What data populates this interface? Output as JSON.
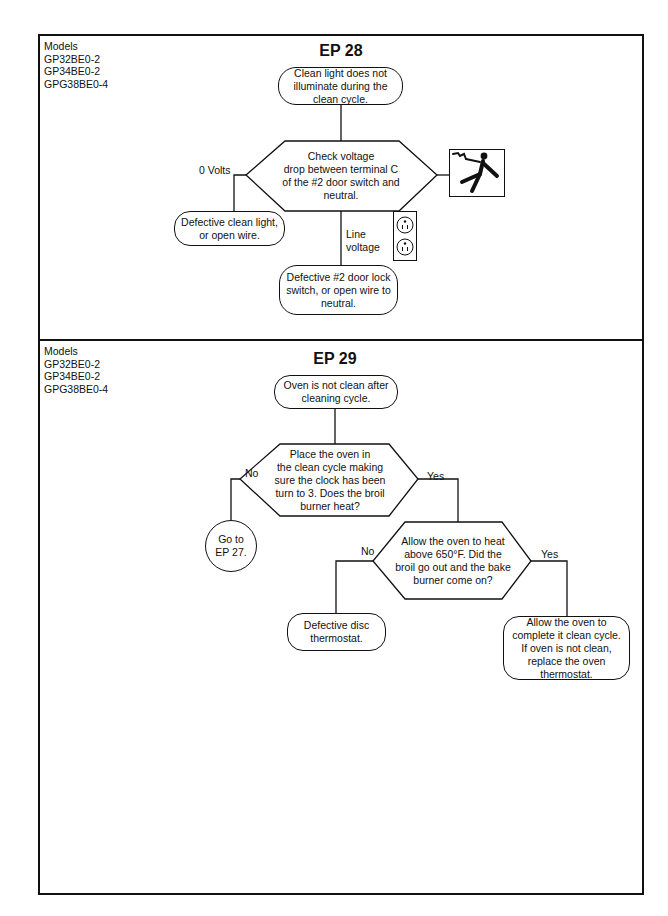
{
  "sections": [
    {
      "id": "ep28",
      "title": "EP 28",
      "models": [
        "Models",
        "GP32BE0-2",
        "GP34BE0-2",
        "GPG38BE0-4"
      ],
      "nodes": {
        "start": [
          "Clean light does not",
          "illuminate during the",
          "clean cycle."
        ],
        "decision": [
          "Check voltage",
          "drop between terminal C",
          "of the #2 door switch and",
          "neutral."
        ],
        "left_result": [
          "Defective clean light,",
          "or open wire."
        ],
        "bottom_result": [
          "Defective #2 door lock",
          "switch, or open wire to",
          "neutral."
        ]
      },
      "labels": {
        "left_branch": "0 Volts",
        "bottom_branch": [
          "Line",
          "voltage"
        ]
      },
      "icons": [
        "electrical-shock-hazard-icon",
        "duplex-outlet-icon"
      ]
    },
    {
      "id": "ep29",
      "title": "EP 29",
      "models": [
        "Models",
        "GP32BE0-2",
        "GP34BE0-2",
        "GPG38BE0-4"
      ],
      "nodes": {
        "start": [
          "Oven is not clean after",
          "cleaning cycle."
        ],
        "decision1": [
          "Place the oven in",
          "the clean cycle making",
          "sure the clock has been",
          "turn to 3.  Does the broil",
          "burner heat?"
        ],
        "no_result": [
          "Go to",
          "EP 27."
        ],
        "decision2": [
          "Allow the oven to heat",
          "above 650°F.  Did the",
          "broil go out and the bake",
          "burner come on?"
        ],
        "no2_result": [
          "Defective disc",
          "thermostat."
        ],
        "yes2_result": [
          "Allow the oven to",
          "complete it clean cycle.",
          "If oven is not clean,",
          "replace the oven",
          "thermostat."
        ]
      },
      "labels": {
        "d1_no": "No",
        "d1_yes": "Yes",
        "d2_no": "No",
        "d2_yes": "Yes"
      }
    }
  ]
}
